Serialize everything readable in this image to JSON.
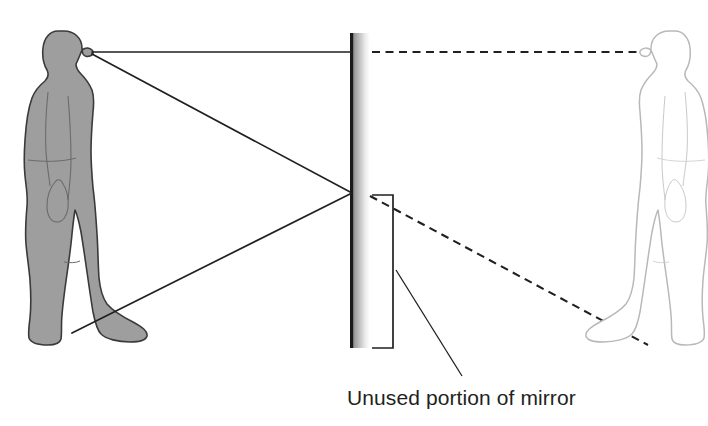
{
  "diagram": {
    "background_color": "#ffffff",
    "annotation": {
      "label": "Unused portion of mirror",
      "label_color": "#231f20",
      "bracket_color": "#231f20",
      "leader_color": "#231f20"
    },
    "mirror": {
      "name": "mirror",
      "surface_color": "#1a1a1a",
      "glass_gradient_from": "#8c8c8c",
      "glass_gradient_to": "#ffffff",
      "top_y": 33,
      "bottom_y": 348,
      "surface_x": 352,
      "thickness": 17
    },
    "observer": {
      "name": "observer-figure",
      "description": "Person standing, facing right toward the mirror",
      "fill_color": "#9e9e9e",
      "outline_color": "#3a3a3a",
      "eye_point": [
        92,
        52
      ],
      "foot_point": [
        72,
        333
      ]
    },
    "image": {
      "name": "reflected-image-figure",
      "description": "Virtual mirror image of the person, outline only, facing left",
      "fill_color": "#ffffff",
      "outline_color": "#b8b8b8",
      "eye_point": [
        641,
        52
      ],
      "foot_point": [
        646,
        345
      ]
    },
    "rays": {
      "solid_color": "#231f20",
      "dashed_color": "#231f20",
      "reflection_point_top": [
        352,
        52
      ],
      "reflection_point_bottom": [
        352,
        193
      ],
      "solid_label": "incident and reflected rays",
      "dashed_label": "virtual ray extensions to image"
    }
  }
}
